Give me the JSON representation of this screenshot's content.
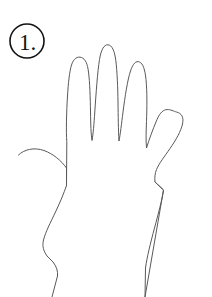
{
  "page": {
    "background_color": "#ffffff",
    "width": 212,
    "height": 297
  },
  "badge": {
    "label": "1.",
    "number": "1",
    "punctuation": ".",
    "shape": "circle",
    "stroke_color": "#131313",
    "fill_color": "#ffffff",
    "center_x": 27,
    "center_y": 41,
    "radius": 17
  },
  "drawing": {
    "name": "hand-outline",
    "subject": "left hand, palm facing viewer, fingers spread",
    "stroke_color": "#59595c",
    "stroke_width": 1,
    "fill": "none",
    "parts": [
      {
        "name": "thumb",
        "tip_x": 18,
        "tip_y": 155
      },
      {
        "name": "index-finger",
        "tip_x": 78,
        "tip_y": 57
      },
      {
        "name": "middle-finger",
        "tip_x": 108,
        "tip_y": 45
      },
      {
        "name": "ring-finger",
        "tip_x": 139,
        "tip_y": 66
      },
      {
        "name": "pinky-finger",
        "tip_x": 180,
        "tip_y": 112
      },
      {
        "name": "palm"
      },
      {
        "name": "wrist-left-edge"
      },
      {
        "name": "wrist-right-edge"
      }
    ],
    "outline_path": "M 18.5 155.0 C 24.0 149.5 34.0 147.0 44.0 150.5 C 53.5 154.0 61.0 160.5 66.5 168.0 L 66.5 185.5 L 66.8 141.5 C 66.0 132.0 66.5 112.0 67.5 96.0 C 68.3 83.0 69.5 71.5 71.5 65.0 C 73.5 58.5 77.5 56.0 81.5 57.5 C 85.5 59.0 87.5 64.0 88.5 72.0 C 89.8 82.0 90.3 98.0 90.5 112.0 C 90.7 125.0 91.0 134.0 92.0 140.5 C 93.2 134.0 94.0 124.0 94.8 112.0 C 96.0 94.0 97.5 72.0 99.5 59.5 C 101.2 49.5 104.0 44.5 108.0 44.8 C 112.0 45.2 114.5 50.5 115.8 60.5 C 117.2 71.5 117.8 88.0 118.0 102.0 C 118.2 116.0 118.3 130.0 119.0 141.0 C 120.3 134.5 121.5 124.0 123.0 112.0 C 125.0 96.5 127.5 80.0 130.5 71.0 C 133.0 63.5 136.0 60.5 139.5 62.0 C 143.0 63.5 145.0 69.5 146.0 79.5 C 147.2 91.5 147.0 108.0 146.5 121.5 C 146.1 132.0 145.8 140.5 146.5 148.0 C 149.0 140.0 152.5 130.0 157.0 119.5 C 163.5 104.5 171.0 110.5 176.5 112.0 C 181.5 113.3 184.0 117.0 182.5 124.0 C 181.0 131.0 176.0 140.0 170.0 148.5 C 164.5 156.5 159.0 163.5 156.5 169.5 C 155.0 173.2 154.5 177.5 155.0 182.0 L 163.5 190.0 L 145.0 297.0",
    "wrist_left_path": "M 66.5 185.5 C 64.0 193.0 60.0 202.5 55.5 212.0 C 50.5 222.5 45.5 232.0 43.5 240.0 C 42.0 246.0 43.5 251.0 47.0 256.0 L 53.0 262.0 C 56.5 266.5 58.0 271.0 57.5 276.0 L 52.0 297.0",
    "wrist_right_path": "M 155.0 182.0 L 163.5 190.0 C 162.0 200.0 158.5 213.0 154.5 228.0 C 150.5 243.0 147.0 257.0 145.5 268.0 L 145.0 297.0"
  }
}
